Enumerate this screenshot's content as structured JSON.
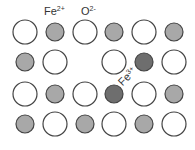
{
  "colors": {
    "oxygen_fill": "#ffffff",
    "fe2_fill": "#a8a8a8",
    "fe3_fill": "#6e6e6e",
    "outline": "#444444"
  },
  "labels": {
    "fe2": {
      "base": "Fe",
      "charge": "2+"
    },
    "o2": {
      "base": "O",
      "charge": "2-"
    },
    "fe3": {
      "base": "Fe",
      "charge": "3+"
    }
  },
  "lattice": {
    "columns_x": [
      25,
      55,
      85,
      114,
      144,
      174
    ],
    "rows": [
      {
        "y": 32,
        "sites": [
          "O",
          "Fe2",
          "O",
          "Fe2",
          "O",
          "Fe2"
        ]
      },
      {
        "y": 62,
        "sites": [
          "Fe2",
          "O",
          "vacancy",
          "O",
          "Fe3",
          "O"
        ]
      },
      {
        "y": 94,
        "sites": [
          "O",
          "Fe2",
          "O",
          "Fe3",
          "O",
          "Fe2"
        ]
      },
      {
        "y": 124,
        "sites": [
          "Fe2",
          "O",
          "Fe2",
          "O",
          "Fe2",
          "O"
        ]
      }
    ]
  }
}
